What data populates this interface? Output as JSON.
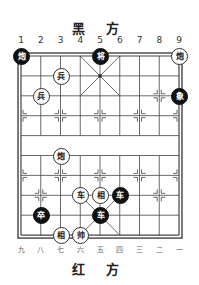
{
  "header": {
    "title": "黑 方"
  },
  "footer": {
    "title": "红 方"
  },
  "top_labels": [
    "1",
    "2",
    "3",
    "4",
    "5",
    "6",
    "7",
    "8",
    "9"
  ],
  "bottom_labels": [
    "九",
    "八",
    "七",
    "六",
    "五",
    "四",
    "三",
    "二",
    "一"
  ],
  "colors": {
    "line": "#444",
    "black_piece": "#111",
    "red_piece_bg": "#ffffff"
  },
  "pieces": [
    {
      "side": "black",
      "char": "炮",
      "col": 1,
      "row": 0
    },
    {
      "side": "black",
      "char": "将",
      "col": 5,
      "row": 0
    },
    {
      "side": "red",
      "char": "炮",
      "col": 9,
      "row": 0
    },
    {
      "side": "red",
      "char": "兵",
      "col": 3,
      "row": 1
    },
    {
      "side": "red",
      "char": "兵",
      "col": 2,
      "row": 2
    },
    {
      "side": "black",
      "char": "象",
      "col": 9,
      "row": 2
    },
    {
      "side": "red",
      "char": "炮",
      "col": 3,
      "row": 5
    },
    {
      "side": "red",
      "char": "车",
      "col": 4,
      "row": 7
    },
    {
      "side": "red",
      "char": "相",
      "col": 5,
      "row": 7
    },
    {
      "side": "black",
      "char": "车",
      "col": 6,
      "row": 7
    },
    {
      "side": "black",
      "char": "卒",
      "col": 2,
      "row": 8
    },
    {
      "side": "black",
      "char": "车",
      "col": 5,
      "row": 8
    },
    {
      "side": "red",
      "char": "相",
      "col": 3,
      "row": 9
    },
    {
      "side": "red",
      "char": "帅",
      "col": 4,
      "row": 9
    }
  ]
}
